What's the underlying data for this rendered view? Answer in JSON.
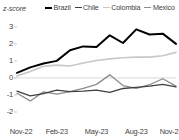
{
  "chart_data": {
    "type": "line",
    "title": "",
    "subtitle": "",
    "xlabel": "",
    "ylabel": "z-score",
    "ylim": [
      -2,
      3.4
    ],
    "yticks": [
      3,
      2,
      1,
      0,
      -1,
      -2
    ],
    "ytick_labels": [
      "3",
      "2",
      "1",
      "0",
      "-1",
      "-2"
    ],
    "grid": false,
    "zero_line": true,
    "legend_position": "top",
    "x": [
      "Nov-22",
      "Dec-22",
      "Jan-23",
      "Feb-23",
      "Mar-23",
      "Apr-23",
      "May-23",
      "Jun-23",
      "Jul-23",
      "Aug-23",
      "Sep-23",
      "Oct-23",
      "Nov-23"
    ],
    "xtick_labels": [
      "Nov-22",
      "Feb-23",
      "May-23",
      "Aug-23",
      "Nov-23"
    ],
    "xtick_indices": [
      0,
      3,
      6,
      9,
      12
    ],
    "series": [
      {
        "name": "Brazil",
        "color": "#000000",
        "width": 2.0,
        "values": [
          0.3,
          0.62,
          0.85,
          1.0,
          1.62,
          1.85,
          1.82,
          2.5,
          2.05,
          2.85,
          2.55,
          2.6,
          2.0
        ]
      },
      {
        "name": "Chile",
        "color": "#404040",
        "width": 1.3,
        "values": [
          -0.78,
          -1.05,
          -0.92,
          -0.72,
          -0.8,
          -0.78,
          -0.72,
          -0.85,
          -0.62,
          -0.55,
          -0.48,
          -0.38,
          -0.52
        ]
      },
      {
        "name": "Colombia",
        "color": "#c8c8c8",
        "width": 1.6,
        "values": [
          0.12,
          0.38,
          0.68,
          0.75,
          0.7,
          0.88,
          1.02,
          1.12,
          1.18,
          1.22,
          1.22,
          1.3,
          1.5
        ]
      },
      {
        "name": "Mexico",
        "color": "#8c8c8c",
        "width": 1.3,
        "values": [
          -0.9,
          -1.35,
          -0.82,
          -0.95,
          -0.8,
          -0.62,
          -0.38,
          0.18,
          -0.45,
          -0.62,
          -0.4,
          -0.05,
          -0.48
        ]
      }
    ]
  },
  "legend": {
    "items": [
      {
        "label": "Brazil"
      },
      {
        "label": "Chile"
      },
      {
        "label": "Colombia"
      },
      {
        "label": "Mexico"
      }
    ]
  },
  "axis": {
    "y_title": "z-score"
  },
  "colors": {
    "brazil": "#000000",
    "chile": "#404040",
    "colombia": "#c8c8c8",
    "mexico": "#8c8c8c",
    "zero_line": "#d9d9d9",
    "axis_text": "#3f3f3f",
    "background": "#ffffff"
  }
}
